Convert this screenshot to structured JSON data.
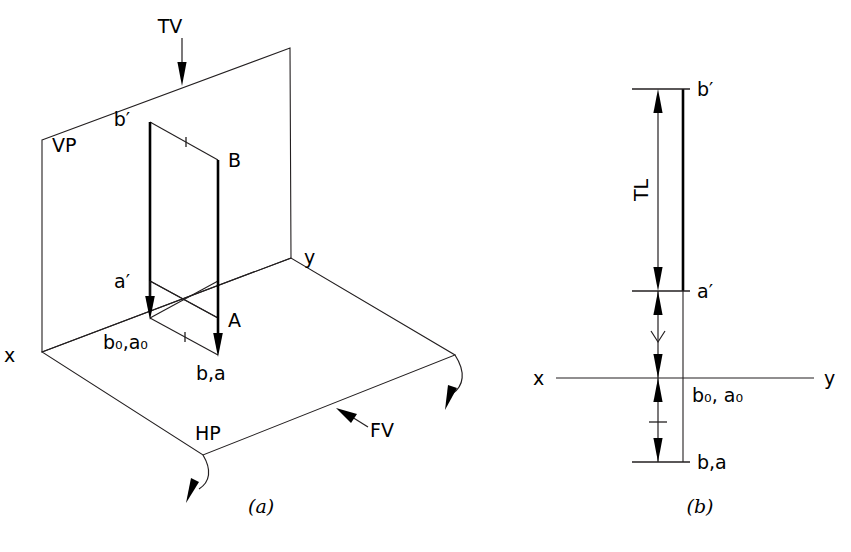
{
  "figure": {
    "background_color": "#ffffff",
    "line_color": "#231f20",
    "accent_color": "#000000",
    "panels": [
      {
        "id": "a",
        "caption": "(a)",
        "description": "Pictorial view of a line AB perpendicular to HP with its projections on VP and HP"
      },
      {
        "id": "b",
        "caption": "(b)",
        "description": "Orthographic projection of the same line showing true length on the front view"
      }
    ]
  },
  "panel_a": {
    "caption": "(a)",
    "plane_labels": {
      "vp": "VP",
      "hp": "HP"
    },
    "axis_labels": {
      "x": "x",
      "y": "y"
    },
    "view_arrows": {
      "top_view": "TV",
      "front_view": "FV"
    },
    "points": {
      "b_prime": "b′",
      "a_prime": "a′",
      "B": "B",
      "A": "A",
      "b0_a0": "b₀,a₀",
      "b_a": "b,a"
    }
  },
  "panel_b": {
    "caption": "(b)",
    "axis_labels": {
      "x": "x",
      "y": "y"
    },
    "dimension_label": "TL",
    "points": {
      "b_prime": "b′",
      "a_prime": "a′",
      "b0_a0": "b₀, a₀",
      "b_a": "b,a"
    }
  }
}
